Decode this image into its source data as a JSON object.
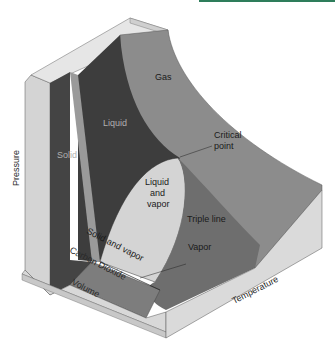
{
  "figure": {
    "substance": "Carbon Dioxide",
    "axes": {
      "pressure": "Pressure",
      "volume": "Volume",
      "temperature": "Temperature"
    },
    "regions": {
      "gas": "Gas",
      "liquid": "Liquid",
      "solid": "Solid",
      "liquid_vapor_line1": "Liquid",
      "liquid_vapor_line2": "and",
      "liquid_vapor_line3": "vapor",
      "solid_vapor": "Solid and vapor",
      "vapor": "Vapor"
    },
    "annotations": {
      "critical_point_line1": "Critical",
      "critical_point_line2": "point",
      "triple_line": "Triple line"
    },
    "colors": {
      "accent_bar": "#2e7d5b",
      "block_face_light": "#d6d6d6",
      "block_top": "#e4e4e4",
      "surface_dark": "#3e3e3e",
      "surface_mid": "#6f6f6f",
      "surface_gas": "#8a8a8a",
      "liquid_vapor_dome": "#d2d2d2"
    }
  }
}
